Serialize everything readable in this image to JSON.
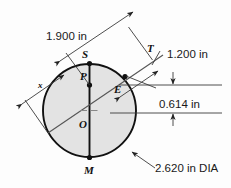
{
  "figure": {
    "type": "engineering-dimension-drawing",
    "background_color": "#fdfdfd",
    "circle_fill_color": "#e3e3e3",
    "line_color": "#111111"
  },
  "dimensions": [
    {
      "id": "dim-1900",
      "label": "1.900 in",
      "value": 1.9,
      "unit": "in"
    },
    {
      "id": "dim-1200",
      "label": "1.200 in",
      "value": 1.2,
      "unit": "in"
    },
    {
      "id": "dim-0614",
      "label": "0.614 in",
      "value": 0.614,
      "unit": "in"
    },
    {
      "id": "dim-dia",
      "label": "2.620 in DIA",
      "value": 2.62,
      "unit": "in"
    },
    {
      "id": "dim-x",
      "label": "x",
      "value": null,
      "unit": "in"
    }
  ],
  "labels": {
    "dim_1900": "1.900 in",
    "dim_1200": "1.200 in",
    "dim_0614": "0.614 in",
    "dim_dia": "2.620 in DIA",
    "dim_x": "x"
  },
  "points": {
    "S": "S",
    "T": "T",
    "P": "P",
    "E": "E",
    "O": "O",
    "M": "M"
  },
  "geometry": {
    "circle": {
      "cx": 89.5,
      "cy": 110.5,
      "r": 47.0,
      "diameter_in": 2.62
    },
    "point_S": {
      "x": 89.5,
      "y": 63.5
    },
    "point_P": {
      "x": 89.5,
      "y": 85.0
    },
    "point_E": {
      "x": 127.0,
      "y": 76.0
    },
    "point_O": {
      "x": 89.5,
      "y": 110.5
    },
    "point_M": {
      "x": 89.5,
      "y": 157.5
    },
    "point_T": {
      "x": 152.0,
      "y": 61.0
    }
  }
}
